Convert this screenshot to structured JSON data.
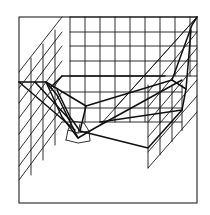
{
  "figure": {
    "colors": {
      "background": "#ffffff",
      "ink": "#111111"
    },
    "frame": {
      "x": 19,
      "y": 17,
      "w": 178,
      "h": 186
    },
    "back_wall": {
      "x1": 70,
      "x2": 197,
      "y1": 17,
      "y2": 76,
      "vlines_x": [
        70,
        85,
        100,
        115,
        130,
        145,
        160,
        175,
        190
      ],
      "hlines_y": [
        17,
        32,
        46,
        61,
        76
      ]
    },
    "left_wall": {
      "diagonals": [
        [
          [
            19,
            72
          ],
          [
            62,
            17
          ]
        ],
        [
          [
            19,
            88
          ],
          [
            62,
            32
          ]
        ],
        [
          [
            19,
            103
          ],
          [
            62,
            46
          ]
        ],
        [
          [
            19,
            118
          ],
          [
            62,
            61
          ]
        ],
        [
          [
            19,
            134
          ],
          [
            62,
            76
          ]
        ],
        [
          [
            19,
            150
          ],
          [
            62,
            92
          ]
        ],
        [
          [
            19,
            166
          ],
          [
            62,
            108
          ]
        ],
        [
          [
            19,
            180
          ],
          [
            62,
            122
          ]
        ]
      ],
      "verticals_x": [
        31,
        43,
        55
      ],
      "vertical_ranges": [
        [
          58,
          175
        ],
        [
          44,
          160
        ],
        [
          30,
          145
        ]
      ]
    },
    "inner_box": {
      "top": [
        [
          62,
          76
        ],
        [
          165,
          76
        ]
      ],
      "left_slant": [
        [
          50,
          88
        ],
        [
          62,
          76
        ]
      ],
      "vlines_x": [
        70,
        85,
        100,
        115,
        130,
        145,
        160
      ],
      "hlines_y": [
        76,
        92,
        108,
        122
      ],
      "x_range": [
        62,
        182
      ]
    },
    "right_panel": {
      "vlines_x": [
        148,
        160,
        172,
        182
      ],
      "top_y": 85,
      "bottom_y": 168,
      "diagonals": [
        [
          [
            148,
            168
          ],
          [
            197,
            112
          ]
        ],
        [
          [
            148,
            152
          ],
          [
            197,
            96
          ]
        ],
        [
          [
            148,
            137
          ],
          [
            197,
            80
          ]
        ],
        [
          [
            148,
            122
          ],
          [
            197,
            64
          ]
        ],
        [
          [
            148,
            107
          ],
          [
            197,
            48
          ]
        ],
        [
          [
            148,
            92
          ],
          [
            197,
            32
          ]
        ],
        [
          [
            115,
            108
          ],
          [
            197,
            17
          ]
        ],
        [
          [
            100,
            125
          ],
          [
            197,
            17
          ]
        ]
      ]
    },
    "surface_lines": [
      [
        [
          19,
          82
        ],
        [
          46,
          82
        ],
        [
          62,
          117
        ],
        [
          78,
          138
        ],
        [
          95,
          128
        ],
        [
          182,
          80
        ]
      ],
      [
        [
          46,
          82
        ],
        [
          57,
          95
        ],
        [
          78,
          138
        ]
      ],
      [
        [
          46,
          82
        ],
        [
          86,
          106
        ],
        [
          172,
          80
        ],
        [
          186,
          89
        ],
        [
          182,
          110
        ],
        [
          100,
          122
        ]
      ],
      [
        [
          57,
          90
        ],
        [
          70,
          117
        ],
        [
          80,
          131
        ]
      ],
      [
        [
          86,
          106
        ],
        [
          80,
          131
        ]
      ],
      [
        [
          172,
          80
        ],
        [
          192,
          25
        ],
        [
          197,
          17
        ]
      ],
      [
        [
          186,
          89
        ],
        [
          191,
          30
        ]
      ],
      [
        [
          19,
          82
        ],
        [
          75,
          130
        ]
      ],
      [
        [
          35,
          82
        ],
        [
          70,
          120
        ]
      ],
      [
        [
          80,
          131
        ],
        [
          148,
          148
        ],
        [
          182,
          110
        ]
      ]
    ],
    "small_box": {
      "front": [
        [
          66,
          140
        ],
        [
          78,
          143
        ],
        [
          90,
          141
        ],
        [
          89,
          131
        ],
        [
          78,
          133
        ],
        [
          68,
          130
        ],
        [
          66,
          140
        ]
      ],
      "back": [
        [
          68,
          130
        ],
        [
          72,
          121
        ],
        [
          84,
          123
        ],
        [
          89,
          131
        ]
      ],
      "inner": [
        [
          78,
          133
        ],
        [
          80,
          124
        ]
      ]
    }
  }
}
